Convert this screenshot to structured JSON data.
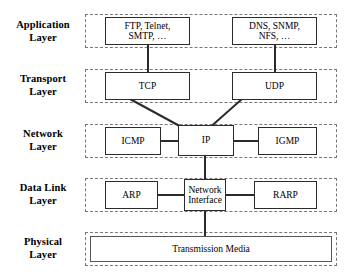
{
  "diagram": {
    "accent_color": "#2b2b2b",
    "band_border_color": "#777777",
    "background": "#ffffff"
  },
  "layers": [
    {
      "id": "application",
      "label_line1": "Application",
      "label_line2": "Layer",
      "nodes": [
        {
          "id": "app-left",
          "line1": "FTP, Telnet,",
          "line2": "SMTP, …"
        },
        {
          "id": "app-right",
          "line1": "DNS, SNMP,",
          "line2": "NFS, …"
        }
      ]
    },
    {
      "id": "transport",
      "label_line1": "Transport",
      "label_line2": "Layer",
      "nodes": [
        {
          "id": "tcp",
          "line1": "TCP",
          "line2": ""
        },
        {
          "id": "udp",
          "line1": "UDP",
          "line2": ""
        }
      ]
    },
    {
      "id": "network",
      "label_line1": "Network",
      "label_line2": "Layer",
      "nodes": [
        {
          "id": "icmp",
          "line1": "ICMP",
          "line2": ""
        },
        {
          "id": "ip",
          "line1": "IP",
          "line2": ""
        },
        {
          "id": "igmp",
          "line1": "IGMP",
          "line2": ""
        }
      ]
    },
    {
      "id": "datalink",
      "label_line1": "Data Link",
      "label_line2": "Layer",
      "nodes": [
        {
          "id": "arp",
          "line1": "ARP",
          "line2": ""
        },
        {
          "id": "nif",
          "line1": "Network",
          "line2": "Interface"
        },
        {
          "id": "rarp",
          "line1": "RARP",
          "line2": ""
        }
      ]
    },
    {
      "id": "physical",
      "label_line1": "Physical",
      "label_line2": "Layer",
      "nodes": [
        {
          "id": "media",
          "line1": "Transmission Media",
          "line2": ""
        }
      ]
    }
  ]
}
